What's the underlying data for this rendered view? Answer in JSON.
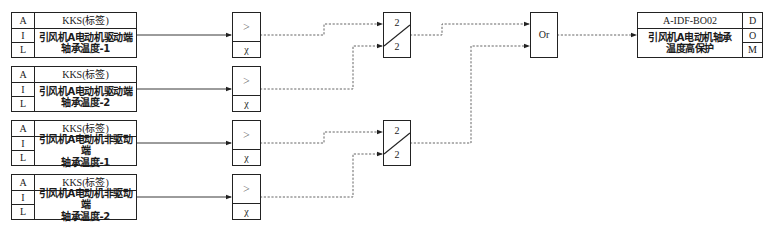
{
  "diagram": {
    "title": "",
    "inputs": [
      {
        "side_labels": [
          "A",
          "I",
          "L"
        ],
        "tag": "KKS(标签)",
        "desc_line1": "引风机A电动机驱动端",
        "desc_line2": "轴承温度-1"
      },
      {
        "side_labels": [
          "A",
          "I",
          "L"
        ],
        "tag": "KKS(标签)",
        "desc_line1": "引风机A电动机驱动端",
        "desc_line2": "轴承温度-2"
      },
      {
        "side_labels": [
          "A",
          "I",
          "L"
        ],
        "tag": "KKS(标签)",
        "desc_line1": "引风机A电动机非驱动端",
        "desc_line2": "轴承温度-1"
      },
      {
        "side_labels": [
          "A",
          "I",
          "L"
        ],
        "tag": "KKS(标签)",
        "desc_line1": "引风机A电动机非驱动端",
        "desc_line2": "轴承温度-2"
      }
    ],
    "comparators": [
      {
        "op": ">",
        "param": "χ"
      },
      {
        "op": ">",
        "param": "χ"
      },
      {
        "op": ">",
        "param": "χ"
      },
      {
        "op": ">",
        "param": "χ"
      }
    ],
    "votes": [
      {
        "top": "2",
        "bottom": "2",
        "logic": "2-out-of-2"
      },
      {
        "top": "2",
        "bottom": "2",
        "logic": "2-out-of-2"
      }
    ],
    "or_gate": {
      "label": "Or"
    },
    "output": {
      "tag": "A-IDF-BO02",
      "desc_line1": "引风机A电动机轴承",
      "desc_line2": "温度高保护",
      "side_labels": [
        "D",
        "O",
        "M"
      ]
    },
    "wire_styles": {
      "analog": "solid",
      "digital": "dashed"
    },
    "colors": {
      "line": "#222222",
      "dashed": "#555555",
      "background": "#ffffff"
    }
  }
}
